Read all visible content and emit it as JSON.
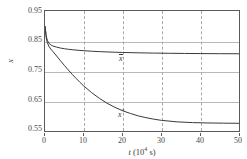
{
  "chart_data": {
    "type": "line",
    "title": "",
    "xlabel": "t (10^4 s)",
    "xlabel_symbol": "t",
    "xlabel_unit_base": "(10",
    "xlabel_unit_exp": "4",
    "xlabel_unit_tail": " s)",
    "ylabel": "x",
    "xlim": [
      0,
      50
    ],
    "ylim": [
      0.55,
      0.95
    ],
    "grid": true,
    "grid_style": {
      "horizontal": "solid",
      "vertical": "dashed",
      "color": "#b9b9b9"
    },
    "legend_position": "inline-annotation",
    "xticks": [
      "0",
      "10",
      "20",
      "30",
      "40",
      "50"
    ],
    "xtick_values": [
      0,
      10,
      20,
      30,
      40,
      50
    ],
    "yticks": [
      "0.95",
      "0.85",
      "0.75",
      "0.65",
      "0.55"
    ],
    "ytick_values": [
      0.95,
      0.85,
      0.75,
      0.65,
      0.55
    ],
    "series": [
      {
        "name": "x-bar",
        "label_symbol": "x",
        "label_decoration": "overbar",
        "color": "#3a3a3a",
        "annotation_x": 20,
        "annotation_y": 0.815,
        "start_value": 0.9,
        "asymptote": 0.801,
        "x": [
          0,
          0.3,
          0.6,
          1,
          1.5,
          2,
          3,
          4,
          5,
          6,
          7,
          8,
          9,
          10,
          12,
          14,
          16,
          18,
          20,
          24,
          28,
          32,
          36,
          40,
          45,
          50
        ],
        "values": [
          0.9,
          0.868,
          0.852,
          0.843,
          0.837,
          0.8335,
          0.8295,
          0.8265,
          0.8243,
          0.8225,
          0.821,
          0.8197,
          0.8186,
          0.8176,
          0.8159,
          0.8146,
          0.8135,
          0.8126,
          0.8118,
          0.8106,
          0.8097,
          0.809,
          0.8085,
          0.8081,
          0.8077,
          0.8074
        ]
      },
      {
        "name": "x-star",
        "label_symbol": "x",
        "label_decoration": "superscript",
        "label_superscript": "*",
        "color": "#3a3a3a",
        "annotation_x": 20,
        "annotation_y": 0.618,
        "start_value": 0.9,
        "asymptote": 0.5755,
        "x": [
          0,
          0.3,
          0.6,
          1,
          1.5,
          2,
          3,
          4,
          5,
          6,
          7,
          8,
          9,
          10,
          12,
          14,
          16,
          18,
          20,
          22,
          24,
          26,
          28,
          30,
          34,
          38,
          42,
          46,
          50
        ],
        "values": [
          0.9,
          0.862,
          0.845,
          0.8325,
          0.823,
          0.8155,
          0.8,
          0.784,
          0.7685,
          0.7535,
          0.739,
          0.7255,
          0.7125,
          0.7,
          0.678,
          0.659,
          0.6425,
          0.629,
          0.6175,
          0.6085,
          0.6005,
          0.5945,
          0.5895,
          0.5855,
          0.5805,
          0.578,
          0.5768,
          0.5761,
          0.5757
        ]
      }
    ]
  }
}
